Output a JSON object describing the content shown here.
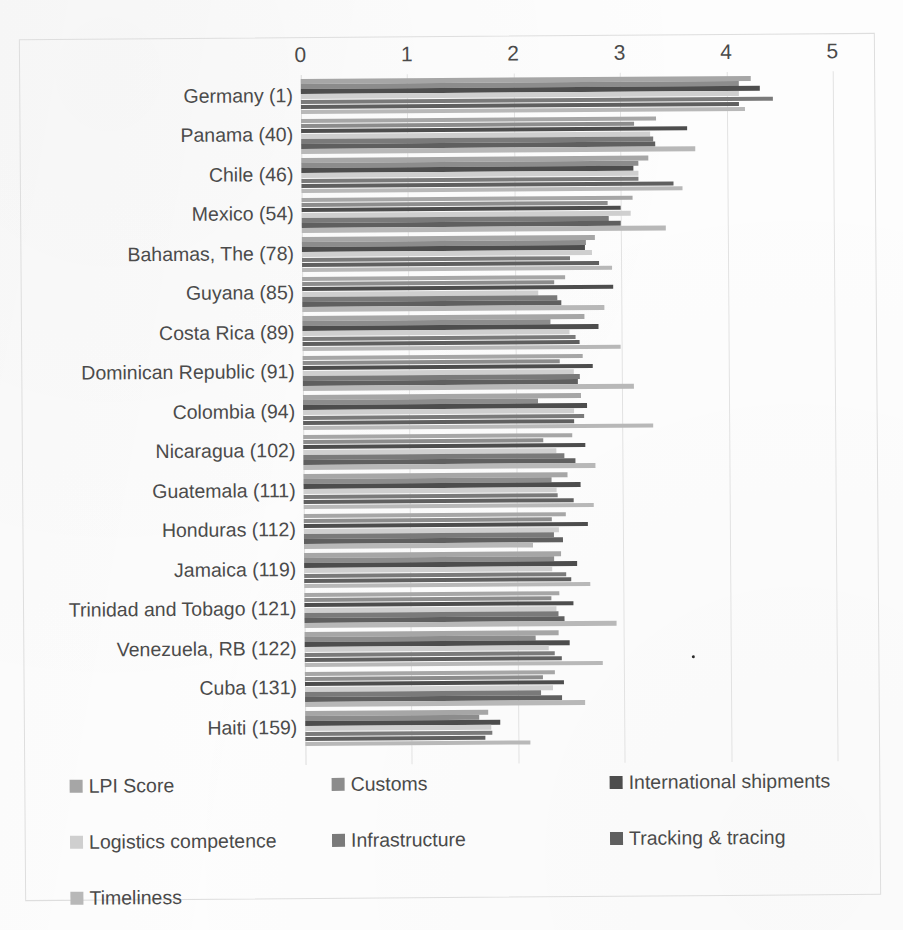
{
  "chart_data": {
    "type": "bar",
    "orientation": "horizontal",
    "title": "",
    "xlabel": "",
    "ylabel": "",
    "xlim": [
      0,
      5
    ],
    "xticks": [
      "0",
      "1",
      "2",
      "3",
      "4",
      "5"
    ],
    "grid": true,
    "legend_position": "bottom",
    "categories": [
      "Germany (1)",
      "Panama (40)",
      "Chile (46)",
      "Mexico (54)",
      "Bahamas, The (78)",
      "Guyana (85)",
      "Costa Rica (89)",
      "Dominican Republic  (91)",
      "Colombia (94)",
      "Nicaragua (102)",
      "Guatemala (111)",
      "Honduras (112)",
      "Jamaica (119)",
      "Trinidad and Tobago (121)",
      "Venezuela, RB (122)",
      "Cuba (131)",
      "Haiti (159)"
    ],
    "series": [
      {
        "name": "LPI Score",
        "color": "#a6a6a6",
        "values": [
          4.23,
          3.34,
          3.26,
          3.11,
          2.75,
          2.47,
          2.65,
          2.63,
          2.61,
          2.53,
          2.48,
          2.46,
          2.42,
          2.4,
          2.39,
          2.35,
          1.72
        ]
      },
      {
        "name": "Customs",
        "color": "#8c8c8c",
        "values": [
          4.12,
          3.13,
          3.17,
          2.88,
          2.67,
          2.37,
          2.33,
          2.42,
          2.21,
          2.26,
          2.33,
          2.33,
          2.35,
          2.32,
          2.17,
          2.24,
          1.64
        ]
      },
      {
        "name": "International shipments",
        "color": "#4d4d4d",
        "values": [
          4.31,
          3.63,
          3.12,
          3.0,
          2.66,
          2.92,
          2.78,
          2.73,
          2.67,
          2.65,
          2.6,
          2.67,
          2.57,
          2.53,
          2.49,
          2.43,
          1.83
        ]
      },
      {
        "name": "Logistics competence",
        "color": "#cfcfcf",
        "values": [
          4.12,
          3.28,
          3.17,
          3.09,
          2.73,
          2.22,
          2.51,
          2.55,
          2.55,
          2.38,
          2.38,
          2.4,
          2.33,
          2.37,
          2.29,
          2.33,
          1.75
        ]
      },
      {
        "name": "Infrastructure",
        "color": "#7a7a7a",
        "values": [
          4.44,
          3.31,
          3.17,
          2.89,
          2.52,
          2.4,
          2.57,
          2.6,
          2.64,
          2.45,
          2.39,
          2.35,
          2.46,
          2.39,
          2.35,
          2.22,
          1.76
        ]
      },
      {
        "name": "Tracking & tracing",
        "color": "#5f5f5f",
        "values": [
          4.12,
          3.33,
          3.5,
          3.0,
          2.79,
          2.43,
          2.6,
          2.58,
          2.55,
          2.56,
          2.54,
          2.43,
          2.51,
          2.44,
          2.42,
          2.42,
          1.69
        ]
      },
      {
        "name": "Timeliness",
        "color": "#b8b8b8",
        "values": [
          4.17,
          3.7,
          3.58,
          3.42,
          2.91,
          2.84,
          2.99,
          3.11,
          3.29,
          2.74,
          2.73,
          2.15,
          2.69,
          2.93,
          2.8,
          2.63,
          2.11
        ]
      }
    ]
  },
  "axis": {
    "tick_values": [
      0,
      1,
      2,
      3,
      4,
      5
    ]
  }
}
